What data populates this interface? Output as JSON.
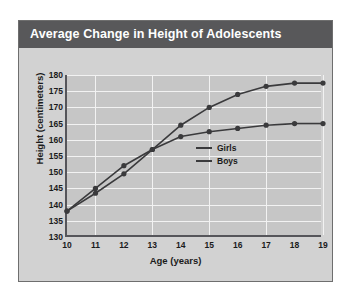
{
  "panel": {
    "title": "Average Change in Height of Adolescents",
    "title_bar_color": "#58585a",
    "background_color": "#d2d2d2",
    "border_color": "#6e6e6e"
  },
  "chart_data": {
    "type": "line",
    "title": "Average Change in Height of Adolescents",
    "xlabel": "Age (years)",
    "ylabel": "Height (centimeters)",
    "x": [
      10,
      11,
      12,
      13,
      14,
      15,
      16,
      17,
      18,
      19
    ],
    "xticks": [
      "10",
      "11",
      "12",
      "13",
      "14",
      "15",
      "16",
      "17",
      "18",
      "19"
    ],
    "yticks": [
      "130",
      "135",
      "140",
      "145",
      "150",
      "155",
      "160",
      "165",
      "170",
      "175",
      "180"
    ],
    "xlim": [
      10,
      19
    ],
    "ylim": [
      130,
      180
    ],
    "grid": true,
    "grid_color": "#f2f2f2",
    "plot_background": "#c6c6c6",
    "legend_position": "center-right",
    "series": [
      {
        "name": "Girls",
        "color": "#3a3a3c",
        "marker": "circle",
        "values": [
          138,
          145,
          152,
          157,
          161,
          162.5,
          163.5,
          164.5,
          165,
          165
        ]
      },
      {
        "name": "Boys",
        "color": "#3a3a3c",
        "marker": "circle",
        "values": [
          138,
          143.5,
          149.5,
          157,
          164.5,
          170,
          174,
          176.5,
          177.5,
          177.5
        ]
      }
    ]
  }
}
